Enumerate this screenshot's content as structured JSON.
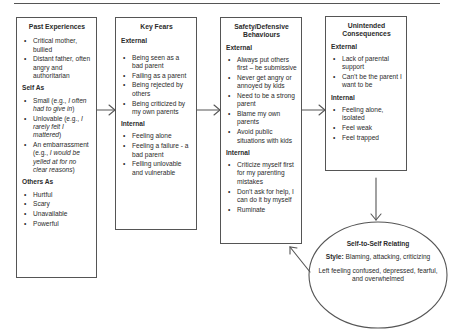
{
  "diagram": {
    "boxes": {
      "past": {
        "title": "Past Experiences",
        "items": [
          "Critical mother, bullied",
          "Distant father, often angry and authoritarian"
        ],
        "self_as_heading": "Self As",
        "self_as": [
          {
            "text": "Small (e.g., ",
            "example": "I often had to give in",
            "close": ")"
          },
          {
            "text": "Unlovable (e.g., ",
            "example": "I rarely felt I mattered",
            "close": ")"
          },
          {
            "text": "An embarrassment (e.g., ",
            "example": "I would be yelled at for no clear reasons",
            "close": ")"
          }
        ],
        "others_as_heading": "Others As",
        "others_as": [
          "Hurtful",
          "Scary",
          "Unavailable",
          "Powerful"
        ]
      },
      "fears": {
        "title": "Key Fears",
        "external_heading": "External",
        "external": [
          "Being seen as a bad parent",
          "Failing as a parent",
          "Being rejected by others",
          "Being criticized by my own parents"
        ],
        "internal_heading": "Internal",
        "internal": [
          "Feeling alone",
          "Feeling a failure - a bad parent",
          "Felling unlovable and vulnerable"
        ]
      },
      "safety": {
        "title": "Safety/Defensive Behaviours",
        "external_heading": "External",
        "external": [
          "Always put others first – be submissive",
          "Never get angry or annoyed by kids",
          "Need to be a strong parent",
          "Blame my own parents",
          "Avoid public situations with kids"
        ],
        "internal_heading": "Internal",
        "internal": [
          "Criticize myself first for my parenting mistakes",
          "Don’t ask for help, I can do it by myself",
          "Ruminate"
        ]
      },
      "consequences": {
        "title": "Unintended Consequences",
        "external_heading": "External",
        "external": [
          "Lack of parental support",
          "Can’t be the parent I want to be"
        ],
        "internal_heading": "Internal",
        "internal": [
          "Feeling alone, isolated",
          "Feel weak",
          "Feel trapped"
        ]
      }
    },
    "ellipse": {
      "title": "Self-to-Self Relating",
      "style_label": "Style:",
      "style_text": " Blaming, attacking, criticizing",
      "result": "Left feeling confused, depressed, fearful, and overwhelmed"
    },
    "colors": {
      "line": "#555555",
      "text": "#2b2b2b",
      "background": "#ffffff"
    }
  }
}
